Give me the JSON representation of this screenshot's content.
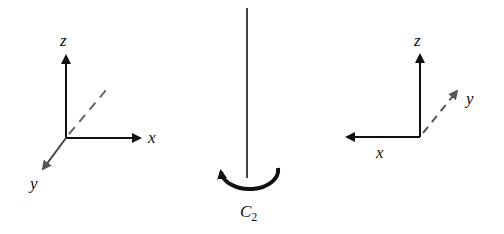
{
  "diagram": {
    "left_frame": {
      "axes": [
        {
          "name": "z",
          "label": "z",
          "direction": "up",
          "style": "solid"
        },
        {
          "name": "x",
          "label": "x",
          "direction": "right",
          "style": "solid"
        },
        {
          "name": "y",
          "label": "y",
          "direction": "down-left (toward viewer)",
          "style": "solid-gray"
        },
        {
          "name": "y-back",
          "label": "",
          "direction": "up-right (behind)",
          "style": "dashed-gray"
        }
      ]
    },
    "rotation_axis": {
      "label_main": "C",
      "label_sub": "2",
      "arc": "half-circle arrow around axis base"
    },
    "right_frame": {
      "axes": [
        {
          "name": "z",
          "label": "z",
          "direction": "up",
          "style": "solid"
        },
        {
          "name": "x",
          "label": "x",
          "direction": "left",
          "style": "solid"
        },
        {
          "name": "y",
          "label": "y",
          "direction": "up-right (away)",
          "style": "dashed-gray-arrow"
        }
      ]
    },
    "colors": {
      "axis": "#111111",
      "depth_axis": "#555555",
      "background": "#ffffff"
    }
  }
}
